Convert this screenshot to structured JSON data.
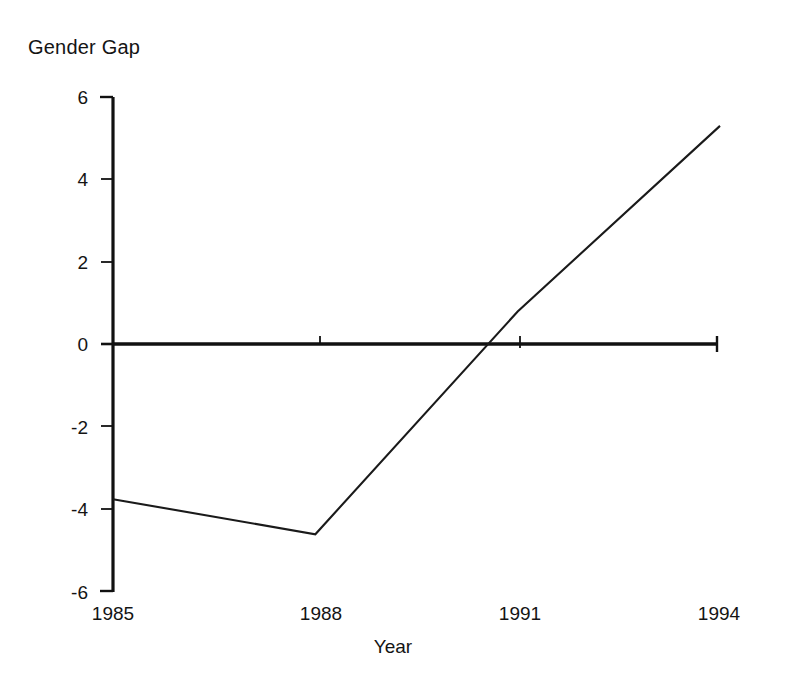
{
  "chart_data": {
    "type": "line",
    "title": "Gender Gap",
    "subtitle": "",
    "xlabel": "Year",
    "ylabel": "Gender Gap",
    "x": [
      1985,
      1988,
      1991,
      1994
    ],
    "values": [
      -3.75,
      -4.6,
      0.8,
      5.3
    ],
    "series": [
      {
        "name": "Gender Gap",
        "values": [
          -3.75,
          -4.6,
          0.8,
          5.3
        ]
      }
    ],
    "xtick_labels": [
      "1985",
      "1988",
      "1991",
      "1994"
    ],
    "xtick_values": [
      1985,
      1988,
      1991,
      1994
    ],
    "ytick_labels": [
      "6",
      "4",
      "2",
      "0",
      "-2",
      "-4",
      "-6"
    ],
    "ytick_values": [
      6,
      4,
      2,
      0,
      -2,
      -4,
      -6
    ],
    "xlim": [
      1985,
      1994
    ],
    "ylim": [
      -6,
      6
    ],
    "grid": false,
    "legend": false,
    "legend_position": "none",
    "zero_line": true,
    "annotations": [],
    "line_color": "#1a1a1a",
    "axis_color": "#111111",
    "background_color": "#ffffff"
  },
  "labels": {
    "title": "Gender Gap",
    "xlabel": "Year",
    "ytick_0": "6",
    "ytick_1": "4",
    "ytick_2": "2",
    "ytick_3": "0",
    "ytick_4": "-2",
    "ytick_5": "-4",
    "ytick_6": "-6",
    "xtick_0": "1985",
    "xtick_1": "1988",
    "xtick_2": "1991",
    "xtick_3": "1994"
  }
}
